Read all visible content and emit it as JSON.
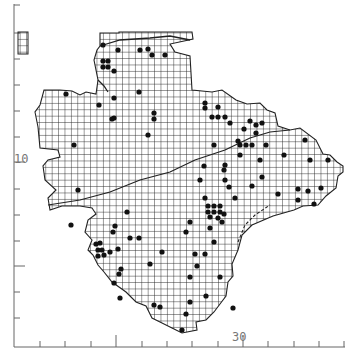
{
  "map": {
    "type": "grid-square distribution map",
    "colors": {
      "background": "#ffffff",
      "grid": "#222222",
      "outline": "#333333",
      "dot": "#111111",
      "axis": "#666666"
    },
    "axes": {
      "x_label": "30",
      "y_label": "10",
      "x_ticks": [
        40,
        65,
        91,
        116,
        142,
        167,
        192,
        218,
        243,
        268,
        294,
        319,
        344
      ],
      "x_major": [
        116,
        243
      ],
      "y_ticks": [
        5,
        33,
        59,
        85,
        111,
        137,
        162,
        189,
        215,
        241,
        266,
        292,
        318
      ],
      "y_major": [
        162,
        266
      ]
    },
    "grid_cell_px": 6.4,
    "records": [
      [
        103,
        45
      ],
      [
        118,
        50
      ],
      [
        140,
        50
      ],
      [
        148,
        49
      ],
      [
        152,
        55
      ],
      [
        165,
        55
      ],
      [
        103,
        61
      ],
      [
        108,
        61
      ],
      [
        103,
        67
      ],
      [
        108,
        67
      ],
      [
        114,
        71
      ],
      [
        66,
        94
      ],
      [
        114,
        98
      ],
      [
        139,
        92
      ],
      [
        154,
        113
      ],
      [
        154,
        119
      ],
      [
        114,
        118
      ],
      [
        148,
        135
      ],
      [
        99,
        105
      ],
      [
        112,
        119
      ],
      [
        74,
        145
      ],
      [
        71,
        225
      ],
      [
        78,
        190
      ],
      [
        205,
        103
      ],
      [
        218,
        107
      ],
      [
        212,
        117
      ],
      [
        218,
        117
      ],
      [
        225,
        117
      ],
      [
        230,
        123
      ],
      [
        244,
        129
      ],
      [
        250,
        121
      ],
      [
        256,
        125
      ],
      [
        262,
        123
      ],
      [
        256,
        133
      ],
      [
        238,
        141
      ],
      [
        240,
        145
      ],
      [
        246,
        145
      ],
      [
        252,
        145
      ],
      [
        266,
        145
      ],
      [
        214,
        145
      ],
      [
        205,
        108
      ],
      [
        240,
        155
      ],
      [
        305,
        140
      ],
      [
        284,
        155
      ],
      [
        310,
        160
      ],
      [
        328,
        160
      ],
      [
        260,
        160
      ],
      [
        225,
        165
      ],
      [
        204,
        166
      ],
      [
        224,
        170
      ],
      [
        200,
        180
      ],
      [
        225,
        180
      ],
      [
        262,
        177
      ],
      [
        252,
        186
      ],
      [
        229,
        187
      ],
      [
        205,
        198
      ],
      [
        235,
        198
      ],
      [
        278,
        194
      ],
      [
        308,
        191
      ],
      [
        321,
        188
      ],
      [
        298,
        189
      ],
      [
        298,
        200
      ],
      [
        314,
        204
      ],
      [
        208,
        206
      ],
      [
        214,
        206
      ],
      [
        220,
        206
      ],
      [
        208,
        212
      ],
      [
        214,
        212
      ],
      [
        220,
        212
      ],
      [
        210,
        217
      ],
      [
        218,
        218
      ],
      [
        224,
        214
      ],
      [
        222,
        222
      ],
      [
        190,
        222
      ],
      [
        186,
        232
      ],
      [
        210,
        228
      ],
      [
        195,
        254
      ],
      [
        205,
        254
      ],
      [
        214,
        242
      ],
      [
        190,
        277
      ],
      [
        190,
        302
      ],
      [
        206,
        296
      ],
      [
        127,
        212
      ],
      [
        115,
        226
      ],
      [
        113,
        232
      ],
      [
        130,
        238
      ],
      [
        139,
        238
      ],
      [
        150,
        264
      ],
      [
        162,
        252
      ],
      [
        96,
        244
      ],
      [
        100,
        243
      ],
      [
        98,
        250
      ],
      [
        102,
        250
      ],
      [
        104,
        255
      ],
      [
        98,
        256
      ],
      [
        118,
        249
      ],
      [
        110,
        252
      ],
      [
        121,
        269
      ],
      [
        119,
        274
      ],
      [
        114,
        283
      ],
      [
        120,
        298
      ],
      [
        154,
        305
      ],
      [
        160,
        307
      ],
      [
        186,
        314
      ],
      [
        233,
        308
      ],
      [
        182,
        330
      ],
      [
        220,
        277
      ],
      [
        197,
        266
      ]
    ]
  }
}
